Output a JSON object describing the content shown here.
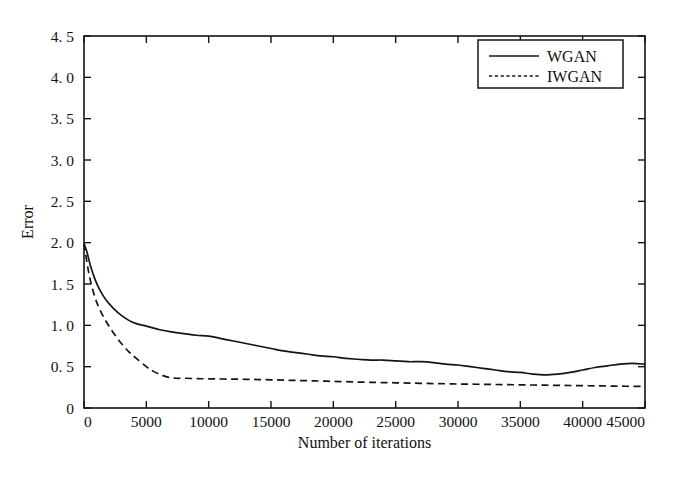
{
  "chart_data": {
    "type": "line",
    "title": "",
    "xlabel": "Number of iterations",
    "ylabel": "Error",
    "xlim": [
      0,
      45000
    ],
    "ylim": [
      0,
      4.5
    ],
    "grid": false,
    "legend_position": "top-right",
    "xticks": [
      0,
      5000,
      10000,
      15000,
      20000,
      25000,
      30000,
      35000,
      40000,
      45000
    ],
    "xtick_labels": [
      "0",
      "5000",
      "10000",
      "15000",
      "20000",
      "25000",
      "30000",
      "35000",
      "40000",
      "45000"
    ],
    "yticks": [
      0,
      0.5,
      1.0,
      1.5,
      2.0,
      2.5,
      3.0,
      3.5,
      4.0,
      4.5
    ],
    "ytick_labels": [
      "0",
      "0. 5",
      "1. 0",
      "1. 5",
      "2. 0",
      "2. 5",
      "3. 0",
      "3. 5",
      "4. 0",
      "4. 5"
    ],
    "series": [
      {
        "name": "WGAN",
        "style": "solid",
        "color": "#141414",
        "x": [
          0,
          250,
          500,
          900,
          1300,
          1800,
          2400,
          3000,
          3600,
          4200,
          5000,
          6000,
          7000,
          8000,
          9000,
          10000,
          11000,
          12000,
          13000,
          14000,
          15000,
          16000,
          17000,
          18000,
          19000,
          20000,
          21000,
          22000,
          23000,
          24000,
          25000,
          26000,
          27000,
          28000,
          29000,
          30000,
          31000,
          32000,
          33000,
          34000,
          35000,
          36000,
          37000,
          38000,
          39000,
          40000,
          41000,
          42000,
          43000,
          44000,
          45000
        ],
        "y": [
          1.99,
          1.88,
          1.73,
          1.55,
          1.42,
          1.3,
          1.2,
          1.12,
          1.06,
          1.02,
          0.99,
          0.95,
          0.92,
          0.9,
          0.88,
          0.87,
          0.84,
          0.81,
          0.78,
          0.75,
          0.72,
          0.69,
          0.67,
          0.65,
          0.63,
          0.62,
          0.6,
          0.59,
          0.58,
          0.58,
          0.57,
          0.56,
          0.56,
          0.55,
          0.53,
          0.52,
          0.5,
          0.48,
          0.46,
          0.44,
          0.43,
          0.41,
          0.4,
          0.41,
          0.43,
          0.46,
          0.49,
          0.51,
          0.53,
          0.54,
          0.53
        ]
      },
      {
        "name": "IWGAN",
        "style": "dashed",
        "color": "#141414",
        "x": [
          0,
          250,
          500,
          900,
          1300,
          1800,
          2400,
          3000,
          3600,
          4200,
          5000,
          5600,
          6200,
          6800,
          7400,
          8000,
          9000,
          10000,
          11000,
          12000,
          13000,
          14000,
          15000,
          16000,
          17000,
          18000,
          19000,
          20000,
          21000,
          22000,
          23000,
          24000,
          25000,
          26000,
          27000,
          28000,
          29000,
          30000,
          31000,
          32000,
          33000,
          34000,
          35000,
          36000,
          37000,
          38000,
          39000,
          40000,
          41000,
          42000,
          43000,
          44000,
          45000
        ],
        "y": [
          1.99,
          1.75,
          1.55,
          1.33,
          1.18,
          1.04,
          0.9,
          0.78,
          0.68,
          0.6,
          0.5,
          0.44,
          0.4,
          0.37,
          0.36,
          0.36,
          0.355,
          0.353,
          0.351,
          0.349,
          0.347,
          0.344,
          0.341,
          0.337,
          0.333,
          0.33,
          0.326,
          0.322,
          0.318,
          0.314,
          0.311,
          0.308,
          0.305,
          0.302,
          0.299,
          0.296,
          0.293,
          0.29,
          0.288,
          0.286,
          0.284,
          0.282,
          0.28,
          0.278,
          0.276,
          0.274,
          0.272,
          0.27,
          0.268,
          0.266,
          0.264,
          0.262,
          0.26
        ]
      }
    ]
  },
  "legend": {
    "entries": [
      {
        "label": "WGAN"
      },
      {
        "label": "IWGAN"
      }
    ]
  }
}
